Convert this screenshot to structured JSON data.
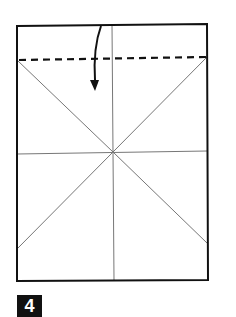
{
  "diagram": {
    "type": "origami-fold-step",
    "step_number": "4",
    "paper": {
      "x": 17,
      "y": 25,
      "width": 190,
      "height": 255
    },
    "center": {
      "x": 113,
      "y": 152
    },
    "fold_line": {
      "type": "valley-dashed",
      "y_left": 60,
      "y_right": 57
    },
    "arrow": {
      "direction": "down",
      "meaning": "fold top edge down"
    },
    "colors": {
      "line": "#111111",
      "crease": "#777777",
      "background": "#ffffff"
    }
  }
}
